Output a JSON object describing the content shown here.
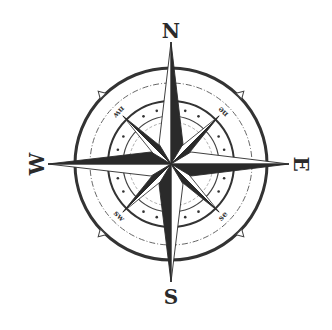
{
  "figure": {
    "title": "",
    "type": "compass-rose",
    "center": [
      171,
      164
    ],
    "colors": {
      "background": "#ffffff",
      "ink_dark": "#2a2a2a",
      "ink_light": "#ffffff",
      "ring": "#333333",
      "ring_thin": "#555555"
    },
    "cardinals": [
      {
        "key": "n",
        "label": "N"
      },
      {
        "key": "e",
        "label": "E"
      },
      {
        "key": "s",
        "label": "S"
      },
      {
        "key": "w",
        "label": "W"
      }
    ],
    "intercardinals": [
      {
        "key": "ne",
        "label": "ne"
      },
      {
        "key": "se",
        "label": "se"
      },
      {
        "key": "sw",
        "label": "sw"
      },
      {
        "key": "nw",
        "label": "nw"
      }
    ],
    "rings": {
      "outer_radius": 96,
      "dashed_radius": 81,
      "middle_radius": 63,
      "dots_radius": 55,
      "inner_radius": 48
    }
  }
}
